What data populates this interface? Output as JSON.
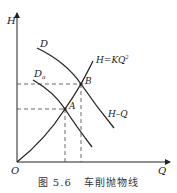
{
  "diagram": {
    "axes": {
      "y_label": "H",
      "x_label": "Q",
      "origin_label": "O"
    },
    "curves": [
      {
        "id": "D",
        "label": "D",
        "description": "pump characteristic curve at original impeller diameter"
      },
      {
        "id": "Da",
        "label": "D",
        "subscript": "a",
        "description": "pump characteristic curve at trimmed impeller diameter"
      },
      {
        "id": "parabola",
        "label": "H=KQ",
        "superscript": "2",
        "description": "trimming parabola"
      },
      {
        "id": "HQ",
        "label": "H–Q",
        "description": "system/pipeline characteristic curve"
      }
    ],
    "points": [
      {
        "label": "A",
        "description": "intersection of Da curve and parabola"
      },
      {
        "label": "B",
        "description": "intersection of D curve and parabola"
      }
    ],
    "caption": {
      "figure_number": "图 5.6",
      "title": "车削抛物线"
    },
    "colors": {
      "line": "#222222",
      "dashed": "#444444",
      "background": "#ffffff"
    }
  }
}
